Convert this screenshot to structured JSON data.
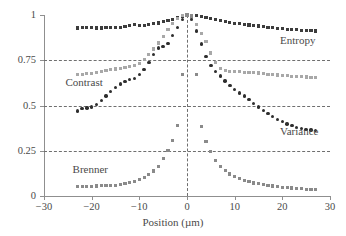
{
  "chart_data": {
    "type": "scatter",
    "title": "",
    "xlabel": "Position (µm)",
    "ylabel": "",
    "xlim": [
      -30,
      30
    ],
    "ylim": [
      0,
      1
    ],
    "xticks": [
      -30,
      -20,
      -10,
      0,
      10,
      20,
      30
    ],
    "xtick_labels": [
      "−30",
      "−20",
      "−10",
      "0",
      "10",
      "20",
      "30"
    ],
    "yticks": [
      0,
      0.25,
      0.5,
      0.75,
      1
    ],
    "ytick_labels": [
      "0",
      "0.25",
      "0.5",
      "0.75",
      "1"
    ],
    "grid": "horizontal dashed at 0.25, 0.5, 0.75; vertical dashed at x=0",
    "legend": "inline text annotations",
    "series": [
      {
        "name": "Entropy",
        "marker": "square",
        "color": "#3c3c3c",
        "label_position": {
          "x": 19.5,
          "y": 0.855
        },
        "x": [
          -23,
          -22,
          -21,
          -20,
          -19,
          -18,
          -17,
          -16,
          -15,
          -14,
          -13,
          -12,
          -11,
          -10,
          -9,
          -8,
          -7,
          -6,
          -5,
          -4,
          -3,
          -2,
          -1,
          0,
          1,
          2,
          3,
          4,
          5,
          6,
          7,
          8,
          9,
          10,
          11,
          12,
          13,
          14,
          15,
          16,
          17,
          18,
          19,
          20,
          21,
          22,
          23,
          24,
          25,
          26,
          27
        ],
        "y": [
          0.928,
          0.929,
          0.929,
          0.929,
          0.928,
          0.928,
          0.929,
          0.93,
          0.931,
          0.933,
          0.936,
          0.94,
          0.946,
          0.942,
          0.944,
          0.948,
          0.952,
          0.956,
          0.962,
          0.968,
          0.976,
          0.986,
          0.995,
          1.0,
          0.999,
          0.996,
          0.991,
          0.985,
          0.979,
          0.973,
          0.968,
          0.963,
          0.959,
          0.955,
          0.951,
          0.948,
          0.945,
          0.942,
          0.939,
          0.936,
          0.933,
          0.93,
          0.927,
          0.925,
          0.922,
          0.92,
          0.918,
          0.916,
          0.914,
          0.913,
          0.912
        ]
      },
      {
        "name": "Contrast",
        "marker": "triangle",
        "color": "#a8a8a8",
        "label_position": {
          "x": -25.5,
          "y": 0.625
        },
        "x": [
          -23,
          -22,
          -21,
          -20,
          -19,
          -18,
          -17,
          -16,
          -15,
          -14,
          -13,
          -12,
          -11,
          -10,
          -9,
          -8,
          -7,
          -6,
          -5,
          -4,
          -3,
          -2,
          -1,
          0,
          1,
          2,
          3,
          4,
          5,
          6,
          7,
          8,
          9,
          10,
          11,
          12,
          13,
          14,
          15,
          16,
          17,
          18,
          19,
          20,
          21,
          22,
          23,
          24,
          25,
          26,
          27
        ],
        "y": [
          0.672,
          0.673,
          0.675,
          0.677,
          0.682,
          0.688,
          0.694,
          0.7,
          0.702,
          0.706,
          0.711,
          0.714,
          0.72,
          0.73,
          0.752,
          0.78,
          0.812,
          0.845,
          0.882,
          0.918,
          0.952,
          0.98,
          0.996,
          1.0,
          0.985,
          0.946,
          0.9,
          0.855,
          0.79,
          0.738,
          0.706,
          0.694,
          0.69,
          0.688,
          0.686,
          0.684,
          0.682,
          0.681,
          0.68,
          0.676,
          0.673,
          0.67,
          0.668,
          0.666,
          0.664,
          0.662,
          0.66,
          0.658,
          0.657,
          0.656,
          0.655
        ]
      },
      {
        "name": "Variance",
        "marker": "circle",
        "color": "#2e2e2e",
        "label_position": {
          "x": 19.5,
          "y": 0.355
        },
        "x": [
          -23,
          -22,
          -21,
          -20,
          -19,
          -18,
          -17,
          -16,
          -15,
          -14,
          -13,
          -12,
          -11,
          -10,
          -9,
          -8,
          -7,
          -6,
          -5,
          -4,
          -3,
          -2,
          -1,
          0,
          1,
          2,
          3,
          4,
          5,
          6,
          7,
          8,
          9,
          10,
          11,
          12,
          13,
          14,
          15,
          16,
          17,
          18,
          19,
          20,
          21,
          22,
          23,
          24,
          25,
          26,
          27
        ],
        "y": [
          0.47,
          0.482,
          0.486,
          0.492,
          0.506,
          0.526,
          0.552,
          0.578,
          0.6,
          0.618,
          0.632,
          0.642,
          0.648,
          0.672,
          0.7,
          0.738,
          0.782,
          0.818,
          0.826,
          0.844,
          0.888,
          0.932,
          0.975,
          0.998,
          0.975,
          0.912,
          0.84,
          0.772,
          0.722,
          0.688,
          0.662,
          0.636,
          0.61,
          0.588,
          0.57,
          0.552,
          0.532,
          0.512,
          0.492,
          0.474,
          0.456,
          0.44,
          0.424,
          0.41,
          0.398,
          0.388,
          0.378,
          0.372,
          0.368,
          0.364,
          0.362
        ]
      },
      {
        "name": "Brenner",
        "marker": "square",
        "color": "#8a8a8a",
        "label_position": {
          "x": -24.0,
          "y": 0.145
        },
        "x": [
          -23,
          -22,
          -21,
          -20,
          -19,
          -18,
          -17,
          -16,
          -15,
          -14,
          -13,
          -12,
          -11,
          -10,
          -9,
          -8,
          -7,
          -6,
          -5,
          -4,
          -3,
          -2,
          -1,
          0,
          1,
          2,
          3,
          4,
          5,
          6,
          7,
          8,
          9,
          10,
          11,
          12,
          13,
          14,
          15,
          16,
          17,
          18,
          19,
          20,
          21,
          22,
          23,
          24,
          25,
          26,
          27
        ],
        "y": [
          0.052,
          0.053,
          0.053,
          0.054,
          0.055,
          0.057,
          0.058,
          0.06,
          0.058,
          0.062,
          0.068,
          0.075,
          0.082,
          0.092,
          0.102,
          0.118,
          0.138,
          0.162,
          0.205,
          0.25,
          0.305,
          0.39,
          0.67,
          1.0,
          0.995,
          0.672,
          0.385,
          0.3,
          0.246,
          0.196,
          0.165,
          0.14,
          0.122,
          0.108,
          0.095,
          0.085,
          0.078,
          0.072,
          0.067,
          0.062,
          0.058,
          0.055,
          0.052,
          0.049,
          0.046,
          0.044,
          0.042,
          0.04,
          0.038,
          0.036,
          0.034
        ]
      }
    ]
  },
  "axis": {
    "xlabel": "Position (µm)"
  }
}
